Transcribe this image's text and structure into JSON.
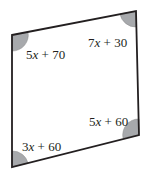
{
  "diagram": {
    "type": "parallelogram",
    "vertices": {
      "top_left": [
        12,
        35
      ],
      "top_right": [
        136,
        11
      ],
      "bottom_right": [
        139,
        135
      ],
      "bottom_left": [
        12,
        167
      ]
    },
    "colors": {
      "stroke": "#231f20",
      "angle_fill": "#a7a9ac",
      "background": "#ffffff"
    },
    "angles": [
      {
        "corner": "top_left",
        "coef": "5",
        "var": "x",
        "op": " + ",
        "const": "70"
      },
      {
        "corner": "top_right",
        "coef": "7",
        "var": "x",
        "op": " + ",
        "const": "30"
      },
      {
        "corner": "bottom_right",
        "coef": "5",
        "var": "x",
        "op": " + ",
        "const": "60"
      },
      {
        "corner": "bottom_left",
        "coef": "3",
        "var": "x",
        "op": " + ",
        "const": "60"
      }
    ]
  }
}
